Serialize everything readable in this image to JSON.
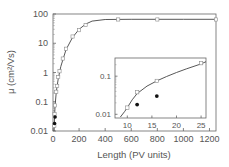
{
  "chart_data": [
    {
      "id": "main",
      "type": "scatter",
      "title": "",
      "xlabel": "Length (PV units)",
      "ylabel": "μ (cm²/Vs)",
      "xscale": "linear",
      "yscale": "log",
      "xlim": [
        0,
        1250
      ],
      "ylim": [
        0.01,
        100
      ],
      "xticks": [
        0,
        200,
        400,
        600,
        800,
        1000,
        1200
      ],
      "yticks": [
        0.01,
        0.1,
        1,
        10,
        100
      ],
      "ytick_labels": [
        "0.01",
        "0.1",
        "1",
        "10",
        "100"
      ],
      "grid": false,
      "series": [
        {
          "name": "open squares",
          "marker": "open-square",
          "color": "#8a8a8a",
          "x": [
            10,
            12,
            16,
            25,
            32,
            40,
            50,
            75,
            100,
            150,
            200,
            250,
            500,
            800,
            1250
          ],
          "y": [
            0.015,
            0.038,
            0.075,
            0.22,
            0.35,
            0.7,
            1.1,
            3.0,
            6.5,
            17,
            28,
            42,
            65,
            65,
            65
          ]
        },
        {
          "name": "filled circles",
          "marker": "filled-circle",
          "color": "#111111",
          "x": [
            12,
            16
          ],
          "y": [
            0.018,
            0.03
          ]
        },
        {
          "name": "fit curve",
          "marker": "line",
          "color": "#444444",
          "x": [
            8.5,
            10,
            12,
            16,
            25,
            40,
            60,
            100,
            150,
            200,
            250,
            300,
            400,
            600,
            800,
            1000,
            1250
          ],
          "y": [
            0.009,
            0.015,
            0.035,
            0.075,
            0.22,
            0.6,
            1.6,
            6.0,
            16,
            30,
            45,
            57,
            65,
            66,
            66,
            66,
            66
          ]
        }
      ]
    },
    {
      "id": "inset",
      "type": "scatter",
      "title": "",
      "xlabel": "",
      "ylabel": "",
      "xscale": "linear",
      "yscale": "log",
      "xlim": [
        7.5,
        26
      ],
      "ylim": [
        0.008,
        0.3
      ],
      "xticks": [
        10,
        15,
        20,
        25
      ],
      "yticks": [
        0.01,
        0.1
      ],
      "ytick_labels": [
        "0.01",
        "0.1"
      ],
      "grid": false,
      "series": [
        {
          "name": "open squares",
          "marker": "open-square",
          "color": "#8a8a8a",
          "x": [
            10,
            12,
            16,
            25
          ],
          "y": [
            0.015,
            0.038,
            0.075,
            0.22
          ]
        },
        {
          "name": "filled circles",
          "marker": "filled-circle",
          "color": "#111111",
          "x": [
            12,
            16
          ],
          "y": [
            0.018,
            0.03
          ]
        },
        {
          "name": "fit curve",
          "marker": "line",
          "color": "#444444",
          "x": [
            8.6,
            9.5,
            10,
            11,
            12,
            14,
            16,
            18,
            20,
            22,
            25,
            26
          ],
          "y": [
            0.0085,
            0.012,
            0.015,
            0.024,
            0.035,
            0.055,
            0.075,
            0.098,
            0.125,
            0.155,
            0.21,
            0.24
          ]
        }
      ]
    }
  ]
}
